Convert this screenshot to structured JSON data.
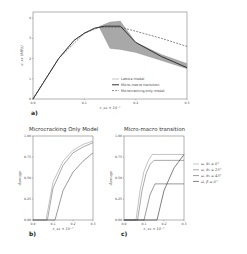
{
  "chart_data": [
    {
      "panel": "a)",
      "type": "line",
      "title": "",
      "xlabel": "ε_xx × 10⁻¹",
      "ylabel": "σ_xx (MPa)",
      "xlim": [
        0,
        0.3
      ],
      "ylim": [
        0,
        4.3
      ],
      "xticks": [
        "0.0",
        "0.1",
        "0.2",
        "0.3"
      ],
      "yticks": [
        "0",
        "1",
        "2",
        "3",
        "4"
      ],
      "legend_position": "lower right",
      "series": [
        {
          "name": "Lattice model",
          "style": "thin solid",
          "x": [
            0.0,
            0.02,
            0.05,
            0.08,
            0.1,
            0.12,
            0.13
          ],
          "y": [
            0.0,
            0.8,
            2.0,
            2.9,
            3.25,
            3.5,
            3.55
          ]
        },
        {
          "name": "Micro-macro transition",
          "style": "thick solid",
          "x": [
            0.0,
            0.02,
            0.05,
            0.08,
            0.1,
            0.12,
            0.14,
            0.17,
            0.2,
            0.25,
            0.3
          ],
          "y": [
            0.0,
            0.8,
            2.0,
            2.9,
            3.25,
            3.5,
            3.6,
            3.6,
            2.8,
            2.1,
            1.55
          ]
        },
        {
          "name": "Microcracking only model",
          "style": "dashed",
          "x": [
            0.0,
            0.05,
            0.1,
            0.13,
            0.17,
            0.2,
            0.25,
            0.3
          ],
          "y": [
            0.0,
            2.0,
            3.25,
            3.55,
            3.55,
            3.35,
            3.0,
            2.6
          ]
        }
      ],
      "band": {
        "name": "Lattice model envelope",
        "x": [
          0.13,
          0.15,
          0.17,
          0.2,
          0.25,
          0.3
        ],
        "y_low": [
          3.5,
          2.5,
          2.45,
          2.3,
          1.9,
          1.5
        ],
        "y_high": [
          3.6,
          3.8,
          3.85,
          2.8,
          2.2,
          1.75
        ]
      }
    },
    {
      "panel": "b)",
      "type": "line",
      "title": "Microcracking Only Model",
      "xlabel": "ε_xx × 10⁻¹",
      "ylabel": "damage",
      "xlim": [
        0,
        0.3
      ],
      "ylim": [
        0,
        1.0
      ],
      "xticks": [
        "0.0",
        "0.1",
        "0.2",
        "0.3"
      ],
      "yticks": [
        "0.00",
        "0.25",
        "0.50",
        "0.75",
        "1.00"
      ],
      "series": [
        {
          "name": "ω, θ₁ = 0°",
          "x": [
            0.0,
            0.065,
            0.1,
            0.15,
            0.2,
            0.25,
            0.3
          ],
          "y": [
            0.0,
            0.0,
            0.45,
            0.7,
            0.83,
            0.9,
            0.94
          ]
        },
        {
          "name": "ω, θ₁ = 25°",
          "x": [
            0.0,
            0.072,
            0.1,
            0.15,
            0.2,
            0.25,
            0.3
          ],
          "y": [
            0.0,
            0.0,
            0.38,
            0.65,
            0.8,
            0.87,
            0.92
          ]
        },
        {
          "name": "ω, θ₁ = 45°",
          "x": [
            0.0,
            0.11,
            0.15,
            0.2,
            0.25,
            0.3
          ],
          "y": [
            0.0,
            0.0,
            0.35,
            0.57,
            0.7,
            0.8
          ]
        }
      ]
    },
    {
      "panel": "c)",
      "type": "line",
      "title": "Micro-macro transition",
      "xlabel": "ε_xx × 10⁻¹",
      "ylabel": "damage",
      "xlim": [
        0,
        0.3
      ],
      "ylim": [
        0,
        1.0
      ],
      "xticks": [
        "0.0",
        "0.1",
        "0.2",
        "0.3"
      ],
      "yticks": [
        "0.00",
        "0.25",
        "0.50",
        "0.75",
        "1.00"
      ],
      "legend_position": "right outside",
      "series": [
        {
          "name": "ω, θ₁ = 0°",
          "x": [
            0.0,
            0.06,
            0.08,
            0.1,
            0.12,
            0.14,
            0.3
          ],
          "y": [
            0.0,
            0.0,
            0.35,
            0.58,
            0.7,
            0.78,
            0.78
          ]
        },
        {
          "name": "ω, θ₁ = 25°",
          "x": [
            0.0,
            0.068,
            0.09,
            0.11,
            0.13,
            0.15,
            0.3
          ],
          "y": [
            0.0,
            0.0,
            0.35,
            0.55,
            0.66,
            0.71,
            0.71
          ]
        },
        {
          "name": "ω, θ₁ = 45°",
          "x": [
            0.0,
            0.1,
            0.13,
            0.155,
            0.3
          ],
          "y": [
            0.0,
            0.0,
            0.3,
            0.43,
            0.43
          ]
        },
        {
          "name": "ω̄, β = 0°",
          "x": [
            0.0,
            0.165,
            0.2,
            0.25,
            0.3
          ],
          "y": [
            0.0,
            0.0,
            0.35,
            0.62,
            0.78
          ]
        }
      ]
    }
  ],
  "labels": {
    "a_panel": "a)",
    "b_panel": "b)",
    "c_panel": "c)",
    "b_title": "Microcracking Only Model",
    "c_title": "Micro-macro transition",
    "xlabel": "ε_xx × 10⁻¹",
    "ylabel_a": "σ_xx (MPa)",
    "ylabel_damage": "damage",
    "legend_a": [
      "Lattice model",
      "Micro-macro transition",
      "Microcracking only model"
    ],
    "legend_c": [
      "ω, θ₁ = 0°",
      "ω, θ₁ = 25°",
      "ω, θ₁ = 45°",
      "ω̄, β = 0°"
    ]
  },
  "colors": {
    "lattice": "#999999",
    "micro_macro": "#333333",
    "dashed": "#555555",
    "band": "#a8a8a8",
    "axes": "#666666"
  }
}
